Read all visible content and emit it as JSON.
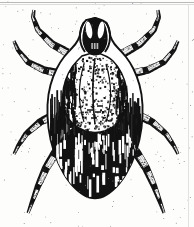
{
  "figure": {
    "kind": "scanned-illustration",
    "alt_text": "Black and white scanned illustration of a tick viewed from above, showing capitulum, scutum, dark idiosoma and eight segmented legs",
    "width": 194,
    "height": 227
  },
  "colors": {
    "background": "#fdfdfc",
    "ink": "#121212",
    "ink_soft": "#2a2a2a",
    "highlight": "#ffffff",
    "speckle": "#4a4a4a",
    "rule_dark": "#b9b9b9",
    "rule_light": "#dcdcdc",
    "rule_right": "#e2e2e2"
  },
  "anatomy": {
    "capitulum": {
      "label": "capitulum",
      "center_x": 95,
      "center_y": 38,
      "width": 30,
      "height": 42
    },
    "scutum": {
      "label": "scutum",
      "center_x": 95,
      "center_y": 92,
      "width": 76,
      "height": 76
    },
    "idiosoma": {
      "label": "idiosoma",
      "center_x": 95,
      "center_y": 140,
      "width": 96,
      "height": 120
    },
    "legs": [
      {
        "name": "leg-left-1",
        "side": "left",
        "index": 1,
        "direction": "up-outward"
      },
      {
        "name": "leg-left-2",
        "side": "left",
        "index": 2,
        "direction": "up-outward"
      },
      {
        "name": "leg-left-3",
        "side": "left",
        "index": 3,
        "direction": "down-outward"
      },
      {
        "name": "leg-left-4",
        "side": "left",
        "index": 4,
        "direction": "down-outward"
      },
      {
        "name": "leg-right-1",
        "side": "right",
        "index": 1,
        "direction": "up-outward"
      },
      {
        "name": "leg-right-2",
        "side": "right",
        "index": 2,
        "direction": "up-outward"
      },
      {
        "name": "leg-right-3",
        "side": "right",
        "index": 3,
        "direction": "down-outward"
      },
      {
        "name": "leg-right-4",
        "side": "right",
        "index": 4,
        "direction": "down-outward"
      }
    ]
  },
  "render_spec": {
    "legs": [
      {
        "id": "leg-left-1",
        "path": [
          [
            88,
            62
          ],
          [
            70,
            54
          ],
          [
            52,
            44
          ],
          [
            38,
            30
          ],
          [
            33,
            17
          ],
          [
            34,
            10
          ]
        ],
        "widths": [
          9.5,
          9.0,
          8.0,
          6.8,
          5.2,
          3.2
        ],
        "joints": [
          0.2,
          0.42,
          0.63,
          0.82
        ]
      },
      {
        "id": "leg-left-2",
        "path": [
          [
            82,
            78
          ],
          [
            62,
            74
          ],
          [
            44,
            70
          ],
          [
            28,
            62
          ],
          [
            18,
            50
          ],
          [
            14,
            41
          ]
        ],
        "widths": [
          9.0,
          8.6,
          7.8,
          6.6,
          5.0,
          3.2
        ],
        "joints": [
          0.22,
          0.44,
          0.66,
          0.84
        ]
      },
      {
        "id": "leg-left-3",
        "path": [
          [
            74,
            108
          ],
          [
            56,
            114
          ],
          [
            40,
            122
          ],
          [
            26,
            134
          ],
          [
            18,
            146
          ],
          [
            14,
            154
          ]
        ],
        "widths": [
          9.5,
          9.0,
          8.0,
          6.6,
          5.0,
          3.0
        ],
        "joints": [
          0.22,
          0.45,
          0.66,
          0.85
        ]
      },
      {
        "id": "leg-left-4",
        "path": [
          [
            68,
            140
          ],
          [
            56,
            152
          ],
          [
            46,
            168
          ],
          [
            38,
            186
          ],
          [
            32,
            202
          ],
          [
            28,
            213
          ]
        ],
        "widths": [
          10.0,
          9.2,
          8.2,
          6.8,
          5.0,
          3.0
        ],
        "joints": [
          0.22,
          0.44,
          0.66,
          0.85
        ]
      },
      {
        "id": "leg-right-1",
        "path": [
          [
            104,
            62
          ],
          [
            122,
            54
          ],
          [
            140,
            44
          ],
          [
            154,
            30
          ],
          [
            159,
            17
          ],
          [
            158,
            10
          ]
        ],
        "widths": [
          9.5,
          9.0,
          8.0,
          6.8,
          5.2,
          3.2
        ],
        "joints": [
          0.2,
          0.42,
          0.63,
          0.82
        ]
      },
      {
        "id": "leg-right-2",
        "path": [
          [
            110,
            78
          ],
          [
            130,
            74
          ],
          [
            148,
            70
          ],
          [
            164,
            62
          ],
          [
            174,
            50
          ],
          [
            178,
            41
          ]
        ],
        "widths": [
          9.0,
          8.6,
          7.8,
          6.6,
          5.0,
          3.2
        ],
        "joints": [
          0.22,
          0.44,
          0.66,
          0.84
        ]
      },
      {
        "id": "leg-right-3",
        "path": [
          [
            118,
            108
          ],
          [
            136,
            114
          ],
          [
            152,
            122
          ],
          [
            166,
            134
          ],
          [
            174,
            146
          ],
          [
            178,
            154
          ]
        ],
        "widths": [
          9.5,
          9.0,
          8.0,
          6.6,
          5.0,
          3.0
        ],
        "joints": [
          0.22,
          0.45,
          0.66,
          0.85
        ]
      },
      {
        "id": "leg-right-4",
        "path": [
          [
            124,
            140
          ],
          [
            136,
            152
          ],
          [
            146,
            168
          ],
          [
            154,
            186
          ],
          [
            160,
            202
          ],
          [
            164,
            213
          ]
        ],
        "widths": [
          10.0,
          9.2,
          8.2,
          6.8,
          5.0,
          3.0
        ],
        "joints": [
          0.22,
          0.44,
          0.66,
          0.85
        ]
      }
    ],
    "body_outline": [
      [
        95,
        18
      ],
      [
        104,
        20
      ],
      [
        109,
        27
      ],
      [
        110,
        36
      ],
      [
        114,
        44
      ],
      [
        122,
        52
      ],
      [
        130,
        62
      ],
      [
        137,
        76
      ],
      [
        142,
        94
      ],
      [
        143,
        116
      ],
      [
        140,
        140
      ],
      [
        132,
        164
      ],
      [
        120,
        184
      ],
      [
        106,
        196
      ],
      [
        95,
        199
      ],
      [
        84,
        196
      ],
      [
        70,
        184
      ],
      [
        58,
        164
      ],
      [
        50,
        140
      ],
      [
        47,
        116
      ],
      [
        48,
        94
      ],
      [
        53,
        76
      ],
      [
        60,
        62
      ],
      [
        68,
        52
      ],
      [
        76,
        44
      ],
      [
        80,
        36
      ],
      [
        81,
        27
      ],
      [
        86,
        20
      ]
    ],
    "scutum_outline": [
      [
        95,
        52
      ],
      [
        108,
        56
      ],
      [
        118,
        66
      ],
      [
        125,
        80
      ],
      [
        128,
        96
      ],
      [
        126,
        112
      ],
      [
        118,
        124
      ],
      [
        106,
        131
      ],
      [
        95,
        133
      ],
      [
        84,
        131
      ],
      [
        72,
        124
      ],
      [
        64,
        112
      ],
      [
        62,
        96
      ],
      [
        65,
        80
      ],
      [
        72,
        66
      ],
      [
        82,
        56
      ]
    ],
    "dark_abdomen_outline": [
      [
        95,
        120
      ],
      [
        112,
        124
      ],
      [
        126,
        134
      ],
      [
        136,
        150
      ],
      [
        140,
        168
      ],
      [
        136,
        182
      ],
      [
        124,
        192
      ],
      [
        108,
        198
      ],
      [
        95,
        199
      ],
      [
        82,
        198
      ],
      [
        66,
        192
      ],
      [
        54,
        182
      ],
      [
        50,
        168
      ],
      [
        54,
        150
      ],
      [
        64,
        134
      ],
      [
        78,
        124
      ]
    ],
    "capitulum_outline": [
      [
        95,
        17
      ],
      [
        101,
        19
      ],
      [
        105,
        24
      ],
      [
        107,
        31
      ],
      [
        108,
        40
      ],
      [
        106,
        48
      ],
      [
        101,
        54
      ],
      [
        95,
        56
      ],
      [
        89,
        54
      ],
      [
        84,
        48
      ],
      [
        82,
        40
      ],
      [
        83,
        31
      ],
      [
        85,
        24
      ],
      [
        89,
        19
      ]
    ],
    "stipple_seed": 20250614,
    "stipple_count": 620,
    "speckle_count": 180
  }
}
